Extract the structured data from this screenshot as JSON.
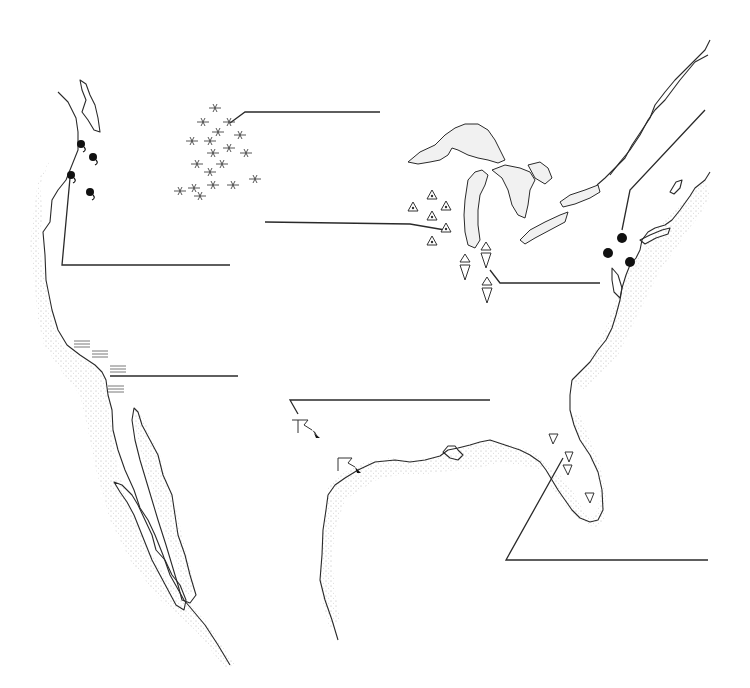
{
  "map": {
    "title": "",
    "region": "Contiguous United States",
    "background_color": "#ffffff",
    "ink_color": "#2a2a2a",
    "features": [
      "west-coast",
      "baja-california",
      "gulf-of-california",
      "gulf-coast",
      "florida-peninsula",
      "east-coast",
      "st-lawrence-river",
      "great-lakes"
    ],
    "marker_groups": [
      {
        "id": "pacific-northwest",
        "symbol": "filled-circle-with-tail",
        "count": 4,
        "region": "Oregon / Washington"
      },
      {
        "id": "northern-plains",
        "symbol": "insect",
        "count": 17,
        "region": "Montana / Dakotas"
      },
      {
        "id": "midwest",
        "symbol": "triangle-with-dot",
        "count": 6,
        "region": "Wisconsin / Iowa / Illinois"
      },
      {
        "id": "indiana-ohio",
        "symbol": "hourglass-triangles",
        "count": 3,
        "region": "Indiana / Ohio"
      },
      {
        "id": "northeast",
        "symbol": "filled-circle",
        "count": 3,
        "region": "New York / New Jersey"
      },
      {
        "id": "california-coast",
        "symbol": "horizontal-dashes",
        "count": 4,
        "region": "California coast"
      },
      {
        "id": "texas",
        "symbol": "flag-with-arrow",
        "count": 2,
        "region": "Texas"
      },
      {
        "id": "florida",
        "symbol": "inverted-triangle",
        "count": 4,
        "region": "Florida"
      }
    ],
    "callouts": [
      {
        "id": "callout-northern-plains",
        "label": ""
      },
      {
        "id": "callout-midwest",
        "label": ""
      },
      {
        "id": "callout-pacific-northwest",
        "label": ""
      },
      {
        "id": "callout-indiana-ohio",
        "label": ""
      },
      {
        "id": "callout-northeast",
        "label": ""
      },
      {
        "id": "callout-california",
        "label": ""
      },
      {
        "id": "callout-texas",
        "label": ""
      },
      {
        "id": "callout-florida",
        "label": ""
      }
    ]
  }
}
